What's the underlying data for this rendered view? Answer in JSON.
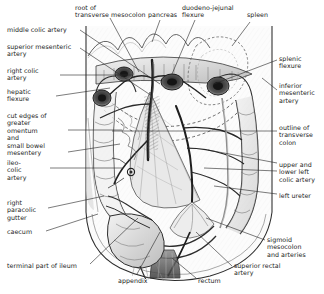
{
  "figure": {
    "type": "anatomical-illustration",
    "width": 324,
    "height": 294,
    "background": "#ffffff",
    "ink": "#1a1a1a"
  },
  "labels": {
    "top": [
      {
        "id": "root-of-transverse-mesocolon",
        "text": "root of\ntransverse mesocolon",
        "x": 75,
        "y": 4,
        "align": "left"
      },
      {
        "id": "pancreas",
        "text": "pancreas",
        "x": 148,
        "y": 11,
        "align": "left"
      },
      {
        "id": "duodeno-jejunal-flexure",
        "text": "duodeno-jejunal\nflexure",
        "x": 182,
        "y": 4,
        "align": "left"
      },
      {
        "id": "spleen",
        "text": "spleen",
        "x": 247,
        "y": 11,
        "align": "left"
      }
    ],
    "left": [
      {
        "id": "middle-colic-artery",
        "text": "middle colic artery",
        "x": 7,
        "y": 26,
        "align": "left"
      },
      {
        "id": "superior-mesenteric-artery",
        "text": "superior mesenteric\nartery",
        "x": 7,
        "y": 43,
        "align": "left"
      },
      {
        "id": "right-colic-artery",
        "text": "right colic\nartery",
        "x": 7,
        "y": 67,
        "align": "left"
      },
      {
        "id": "hepatic-flexure",
        "text": "hepatic\nflexure",
        "x": 7,
        "y": 88,
        "align": "left"
      },
      {
        "id": "cut-edges-of-greater-omentum-and-small-bowel-mesentery",
        "text": "cut edges of\ngreater\nomentum\nand\nsmall bowel\nmesentery",
        "x": 7,
        "y": 112,
        "align": "left"
      },
      {
        "id": "ileo-colic-artery",
        "text": "ileo-\ncolic\nartery",
        "x": 7,
        "y": 159,
        "align": "left"
      },
      {
        "id": "right-paracolic-gutter",
        "text": "right\nparacolic\ngutter",
        "x": 7,
        "y": 199,
        "align": "left"
      },
      {
        "id": "caecum",
        "text": "caecum",
        "x": 7,
        "y": 228,
        "align": "left"
      },
      {
        "id": "terminal-part-of-ileum",
        "text": "terminal part of ileum",
        "x": 7,
        "y": 262,
        "align": "left"
      }
    ],
    "right": [
      {
        "id": "splenic-flexure",
        "text": "splenic\nflexure",
        "x": 279,
        "y": 55,
        "align": "left"
      },
      {
        "id": "inferior-mesenteric-artery",
        "text": "inferior\nmesenteric\nartery",
        "x": 279,
        "y": 82,
        "align": "left"
      },
      {
        "id": "outline-of-transverse-colon",
        "text": "outline of\ntransverse\ncolon",
        "x": 279,
        "y": 124,
        "align": "left"
      },
      {
        "id": "upper-and-lower-left-colic-artery",
        "text": "upper and\nlower left\ncolic artery",
        "x": 279,
        "y": 161,
        "align": "left"
      },
      {
        "id": "left-ureter",
        "text": "left ureter",
        "x": 279,
        "y": 192,
        "align": "left"
      },
      {
        "id": "sigmoid-mesocolon-and-arteries",
        "text": "sigmoid\nmesocolon\nand arteries",
        "x": 267,
        "y": 236,
        "align": "left"
      }
    ],
    "bottom": [
      {
        "id": "appendix",
        "text": "appendix",
        "x": 118,
        "y": 277,
        "align": "left"
      },
      {
        "id": "rectum",
        "text": "rectum",
        "x": 198,
        "y": 277,
        "align": "left"
      },
      {
        "id": "superior-rectal-artery",
        "text": "superior rectal\nartery",
        "x": 234,
        "y": 262,
        "align": "left"
      }
    ]
  },
  "leader_lines": [
    {
      "id": "leader-root-of-transverse-mesocolon",
      "points": "110,18 139,72"
    },
    {
      "id": "leader-pancreas",
      "points": "160,20 152,42"
    },
    {
      "id": "leader-duodeno-jejunal-flexure",
      "points": "195,20 172,74"
    },
    {
      "id": "leader-spleen",
      "points": "250,22 232,46"
    },
    {
      "id": "leader-middle-colic-artery",
      "points": "80,30 160,84"
    },
    {
      "id": "leader-superior-mesenteric-artery",
      "points": "80,48 152,96"
    },
    {
      "id": "leader-right-colic-artery",
      "points": "60,75 132,75"
    },
    {
      "id": "leader-hepatic-flexure",
      "points": "56,96 110,88"
    },
    {
      "id": "leader-cut-edges",
      "points": "68,130 122,130"
    },
    {
      "id": "leader-small-bowel-mesentery",
      "points": "68,152 120,144"
    },
    {
      "id": "leader-ileo-colic-artery",
      "points": "50,168 122,168"
    },
    {
      "id": "leader-right-paracolic-gutter",
      "points": "48,208 104,196"
    },
    {
      "id": "leader-caecum",
      "points": "46,231 98,214"
    },
    {
      "id": "leader-terminal-part-of-ileum",
      "points": "90,264 138,218"
    },
    {
      "id": "leader-appendix",
      "points": "137,274 160,232"
    },
    {
      "id": "leader-rectum",
      "points": "196,278 172,258"
    },
    {
      "id": "leader-superior-rectal-artery",
      "points": "232,266 196,232"
    },
    {
      "id": "leader-sigmoid-mesocolon",
      "points": "265,240 206,218"
    },
    {
      "id": "leader-splenic-flexure",
      "points": "277,60 214,84"
    },
    {
      "id": "leader-inferior-mesenteric-artery",
      "points": "277,90 262,78"
    },
    {
      "id": "leader-outline-of-transverse-colon",
      "points": "277,131 112,131"
    },
    {
      "id": "leader-upper-left-colic-artery",
      "points": "277,163 208,150"
    },
    {
      "id": "leader-lower-left-colic-artery",
      "points": "277,171 204,168"
    },
    {
      "id": "leader-left-ureter",
      "points": "277,194 214,186"
    }
  ]
}
